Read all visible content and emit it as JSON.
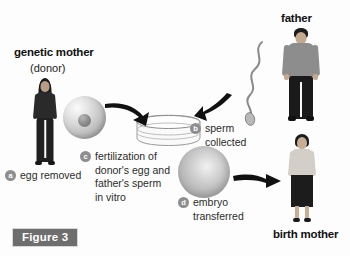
{
  "figure": {
    "caption": "Figure 3"
  },
  "labels": {
    "genetic_mother": "genetic mother",
    "genetic_mother_sub": "(donor)",
    "father": "father",
    "birth_mother": "birth mother"
  },
  "steps": [
    {
      "key": "a",
      "marker": "a",
      "lines": [
        "egg removed"
      ],
      "name": "step-a-egg-removed"
    },
    {
      "key": "b",
      "marker": "b",
      "lines": [
        "sperm",
        "collected"
      ],
      "name": "step-b-sperm-collected"
    },
    {
      "key": "c",
      "marker": "c",
      "lines": [
        "fertilization of",
        "donor's egg and",
        "father's sperm",
        "in vitro"
      ],
      "name": "step-c-fertilization"
    },
    {
      "key": "d",
      "marker": "d",
      "lines": [
        "embryo",
        "transferred"
      ],
      "name": "step-d-embryo-transferred"
    }
  ],
  "diagram_elements": {
    "egg_cell": "egg-cell",
    "sperm_cell": "sperm-cell",
    "petri_dish": "petri-dish",
    "embryo_cell": "embryo-cell",
    "arrow_egg_to_dish": "arrow-egg-to-dish",
    "arrow_sperm_to_dish": "arrow-sperm-to-dish",
    "arrow_embryo_to_birth_mother": "arrow-embryo-to-birth-mother"
  },
  "colors": {
    "background": "#fdfdfd",
    "text": "#111111",
    "bullet_fill": "#8e8e8e",
    "bullet_text": "#ffffff",
    "caption_fill": "#6e6e6e",
    "arrow": "#111111",
    "skin": "#c9b39c",
    "dark_clothing": "#1d1d1d",
    "mid_gray_clothing": "#8a8a8a",
    "light_clothing": "#d6d2cb"
  }
}
